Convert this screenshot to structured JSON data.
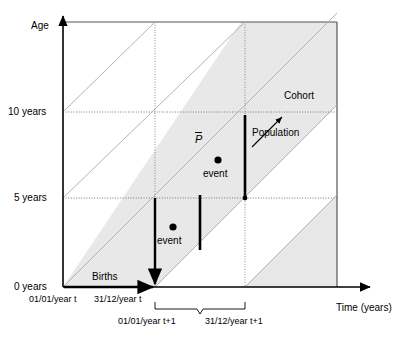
{
  "figure": {
    "type": "lexis-diagram",
    "axes": {
      "y_axis_title": "Age",
      "x_axis_title": "Time (years)",
      "y_ticks": [
        "0 years",
        "5 years",
        "10 years"
      ],
      "y_tick_values": [
        0,
        5,
        10
      ],
      "x_tick_labels": [
        "01/01/year t",
        "31/12/year t",
        "01/01/year t+1",
        "31/12/year t+1"
      ]
    },
    "annotations": {
      "births": "Births",
      "cohort": "Cohort",
      "population": "Population",
      "mean_population_symbol": "P",
      "event_lower": "event",
      "event_upper": "event"
    },
    "colors": {
      "band_fill": "#e8e8e8",
      "axis": "#000000",
      "grid": "#999999",
      "diagonal": "#aaaaaa"
    }
  }
}
